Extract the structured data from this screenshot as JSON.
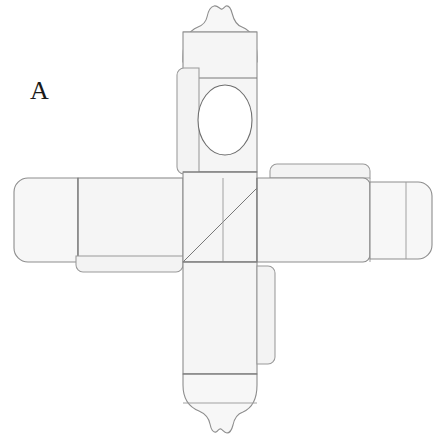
{
  "figure": {
    "label": "A",
    "width_px": 445,
    "height_px": 436
  },
  "style": {
    "background_color": "#ffffff",
    "panel_fill": "#f5f5f5",
    "panel_fill_light": "#f8f8f8",
    "tab_fill": "#f2f2f2",
    "outline_color": "#8a8a8a",
    "fold_line_color": "#707070",
    "score_line_color": "#9a9a9a",
    "window_stroke": "#6e6e6e",
    "label_color": "#1a1a1a",
    "outline_width": 1.1,
    "fold_width": 1.0
  },
  "parts": {
    "top_decorative_flap": {
      "name": "Top decorative scalloped closure flap",
      "has_ornate_crown": true,
      "scallop_count": 4
    },
    "top_panel_with_window": {
      "name": "Upper front panel with oval display window",
      "window_shape": "oval",
      "window_center_x": 225,
      "window_center_y": 120,
      "window_rx": 27,
      "window_ry": 35
    },
    "upper_left_glue_tab": {
      "name": "Upper left side glue tab"
    },
    "left_arm_panel": {
      "name": "Left side panel"
    },
    "left_end_flap": {
      "name": "Left end closure flap, rounded corners"
    },
    "left_lower_glue_tab": {
      "name": "Lower left glue tab"
    },
    "center_panel": {
      "name": "Center base panel with diagonal score line",
      "diagonal_score": true
    },
    "right_arm_panel": {
      "name": "Right side panel"
    },
    "right_end_flap": {
      "name": "Right end closure flap, rounded corners"
    },
    "right_upper_glue_tab": {
      "name": "Upper right glue tab"
    },
    "bottom_panel": {
      "name": "Lower back panel"
    },
    "bottom_right_glue_tab": {
      "name": "Lower right side glue tab"
    },
    "bottom_decorative_flap": {
      "name": "Bottom decorative scalloped closure flap",
      "has_ornate_crown": true,
      "scallop_count": 4
    }
  }
}
